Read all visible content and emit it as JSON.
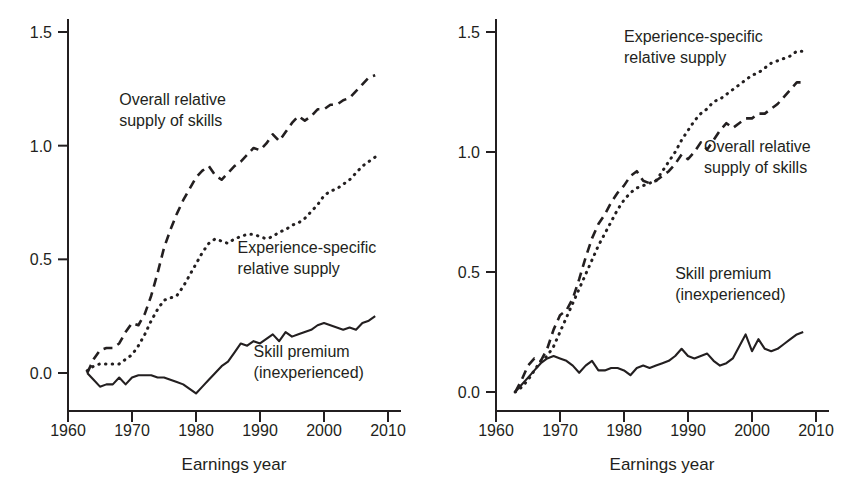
{
  "figure": {
    "panels": [
      {
        "id": "left",
        "name": "left-panel",
        "xlabel": "Earnings year",
        "ylabel": "",
        "xticks": [
          1960,
          1970,
          1980,
          1990,
          2000,
          2010
        ],
        "xticklabels": [
          "1960",
          "1970",
          "1980",
          "1990",
          "2000",
          "2010"
        ],
        "yticks": [
          0.0,
          0.5,
          1.0,
          1.5
        ],
        "yticklabels": [
          "0.0",
          "0.5",
          "1.0",
          "1.5"
        ],
        "annotations": [
          {
            "name": "annotation-overall-relative-supply",
            "lines": [
              "Overall relative",
              "supply of skills"
            ],
            "x": 1968.0,
            "y": 1.18,
            "anchor": "start"
          },
          {
            "name": "annotation-experience-specific-supply",
            "lines": [
              "Experience-specific",
              "relative supply"
            ],
            "x": 1986.5,
            "y": 0.53,
            "anchor": "start"
          },
          {
            "name": "annotation-skill-premium",
            "lines": [
              "Skill premium",
              "(inexperienced)"
            ],
            "x": 1989.0,
            "y": 0.07,
            "anchor": "start"
          }
        ]
      },
      {
        "id": "right",
        "name": "right-panel",
        "xlabel": "Earnings year",
        "ylabel": "",
        "xticks": [
          1960,
          1970,
          1980,
          1990,
          2000,
          2010
        ],
        "xticklabels": [
          "1960",
          "1970",
          "1980",
          "1990",
          "2000",
          "2010"
        ],
        "yticks": [
          0.0,
          0.5,
          1.0,
          1.5
        ],
        "yticklabels": [
          "0.0",
          "0.5",
          "1.0",
          "1.5"
        ],
        "annotations": [
          {
            "name": "annotation-experience-specific-supply",
            "lines": [
              "Experience-specific",
              "relative supply"
            ],
            "x": 1980.0,
            "y": 1.46,
            "anchor": "start"
          },
          {
            "name": "annotation-overall-relative-supply",
            "lines": [
              "Overall relative",
              "supply of skills"
            ],
            "x": 1992.5,
            "y": 1.0,
            "anchor": "start"
          },
          {
            "name": "annotation-skill-premium",
            "lines": [
              "Skill premium",
              "(inexperienced)"
            ],
            "x": 1988.0,
            "y": 0.47,
            "anchor": "start"
          }
        ]
      }
    ]
  },
  "chart_data": [
    {
      "type": "line",
      "panel": "left",
      "title": "",
      "xlabel": "Earnings year",
      "ylabel": "",
      "xlim": [
        1960,
        2010
      ],
      "ylim": [
        -0.12,
        1.55
      ],
      "grid": false,
      "legend": "inline-annotations",
      "x": [
        1963,
        1964,
        1965,
        1966,
        1967,
        1968,
        1969,
        1970,
        1971,
        1972,
        1973,
        1974,
        1975,
        1976,
        1977,
        1978,
        1979,
        1980,
        1981,
        1982,
        1983,
        1984,
        1985,
        1986,
        1987,
        1988,
        1989,
        1990,
        1991,
        1992,
        1993,
        1994,
        1995,
        1996,
        1997,
        1998,
        1999,
        2000,
        2001,
        2002,
        2003,
        2004,
        2005,
        2006,
        2007,
        2008
      ],
      "series": [
        {
          "name": "Overall relative supply of skills",
          "style": "dashed",
          "values": [
            0.0,
            0.06,
            0.1,
            0.11,
            0.11,
            0.13,
            0.18,
            0.22,
            0.21,
            0.26,
            0.34,
            0.44,
            0.55,
            0.63,
            0.7,
            0.76,
            0.81,
            0.86,
            0.89,
            0.91,
            0.87,
            0.85,
            0.88,
            0.91,
            0.93,
            0.96,
            0.99,
            0.98,
            1.01,
            1.05,
            1.02,
            1.06,
            1.1,
            1.13,
            1.11,
            1.13,
            1.16,
            1.16,
            1.18,
            1.18,
            1.2,
            1.21,
            1.24,
            1.27,
            1.3,
            1.31
          ]
        },
        {
          "name": "Experience-specific relative supply",
          "style": "dotted",
          "values": [
            0.01,
            0.03,
            0.04,
            0.04,
            0.04,
            0.04,
            0.06,
            0.08,
            0.12,
            0.17,
            0.23,
            0.28,
            0.32,
            0.33,
            0.34,
            0.38,
            0.43,
            0.48,
            0.53,
            0.57,
            0.59,
            0.58,
            0.57,
            0.59,
            0.6,
            0.61,
            0.61,
            0.6,
            0.59,
            0.6,
            0.62,
            0.63,
            0.65,
            0.66,
            0.68,
            0.71,
            0.74,
            0.78,
            0.8,
            0.81,
            0.83,
            0.85,
            0.88,
            0.91,
            0.93,
            0.95
          ]
        },
        {
          "name": "Skill premium (inexperienced)",
          "style": "solid",
          "values": [
            0.0,
            -0.03,
            -0.06,
            -0.05,
            -0.05,
            -0.02,
            -0.05,
            -0.02,
            -0.01,
            -0.01,
            -0.01,
            -0.02,
            -0.02,
            -0.03,
            -0.04,
            -0.05,
            -0.07,
            -0.09,
            -0.06,
            -0.03,
            0.0,
            0.03,
            0.05,
            0.09,
            0.13,
            0.12,
            0.14,
            0.13,
            0.15,
            0.17,
            0.14,
            0.18,
            0.16,
            0.17,
            0.18,
            0.19,
            0.21,
            0.22,
            0.21,
            0.2,
            0.19,
            0.2,
            0.19,
            0.22,
            0.23,
            0.25
          ]
        }
      ]
    },
    {
      "type": "line",
      "panel": "right",
      "title": "",
      "xlabel": "Earnings year",
      "ylabel": "",
      "xlim": [
        1960,
        2010
      ],
      "ylim": [
        0.0,
        1.55
      ],
      "grid": false,
      "legend": "inline-annotations",
      "x": [
        1963,
        1964,
        1965,
        1966,
        1967,
        1968,
        1969,
        1970,
        1971,
        1972,
        1973,
        1974,
        1975,
        1976,
        1977,
        1978,
        1979,
        1980,
        1981,
        1982,
        1983,
        1984,
        1985,
        1986,
        1987,
        1988,
        1989,
        1990,
        1991,
        1992,
        1993,
        1994,
        1995,
        1996,
        1997,
        1998,
        1999,
        2000,
        2001,
        2002,
        2003,
        2004,
        2005,
        2006,
        2007,
        2008
      ],
      "series": [
        {
          "name": "Experience-specific relative supply",
          "style": "dotted",
          "values": [
            0.0,
            0.02,
            0.05,
            0.09,
            0.13,
            0.15,
            0.19,
            0.25,
            0.31,
            0.37,
            0.43,
            0.49,
            0.55,
            0.61,
            0.66,
            0.71,
            0.76,
            0.8,
            0.83,
            0.85,
            0.86,
            0.87,
            0.88,
            0.92,
            0.96,
            1.0,
            1.05,
            1.09,
            1.13,
            1.16,
            1.18,
            1.21,
            1.22,
            1.24,
            1.26,
            1.28,
            1.3,
            1.32,
            1.33,
            1.35,
            1.37,
            1.38,
            1.39,
            1.4,
            1.42,
            1.42
          ]
        },
        {
          "name": "Overall relative supply of skills",
          "style": "dashed",
          "values": [
            0.0,
            0.05,
            0.11,
            0.14,
            0.13,
            0.18,
            0.26,
            0.32,
            0.34,
            0.39,
            0.47,
            0.56,
            0.64,
            0.7,
            0.74,
            0.79,
            0.83,
            0.86,
            0.9,
            0.92,
            0.88,
            0.87,
            0.88,
            0.9,
            0.92,
            0.95,
            0.99,
            0.97,
            1.0,
            1.04,
            1.01,
            1.05,
            1.09,
            1.12,
            1.1,
            1.12,
            1.14,
            1.14,
            1.16,
            1.16,
            1.18,
            1.2,
            1.23,
            1.26,
            1.29,
            1.29
          ]
        },
        {
          "name": "Skill premium (inexperienced)",
          "style": "solid",
          "values": [
            0.0,
            0.03,
            0.06,
            0.09,
            0.12,
            0.14,
            0.15,
            0.14,
            0.13,
            0.11,
            0.08,
            0.11,
            0.13,
            0.09,
            0.09,
            0.1,
            0.1,
            0.09,
            0.07,
            0.1,
            0.11,
            0.1,
            0.11,
            0.12,
            0.13,
            0.15,
            0.18,
            0.15,
            0.14,
            0.15,
            0.16,
            0.13,
            0.11,
            0.12,
            0.14,
            0.19,
            0.24,
            0.17,
            0.22,
            0.18,
            0.17,
            0.18,
            0.2,
            0.22,
            0.24,
            0.25
          ]
        }
      ]
    }
  ]
}
